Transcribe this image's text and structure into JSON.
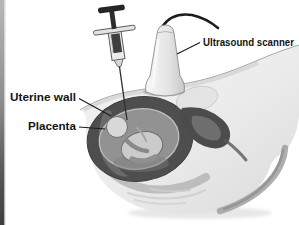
{
  "illustration": {
    "labels": {
      "ultrasound_scanner": "Ultrasound scanner",
      "uterine_wall": "Uterine wall",
      "placenta": "Placenta"
    },
    "palette": {
      "background": "#ffffff",
      "label_text": "#141414",
      "leader_line": "#1a1a1a",
      "uterine_wall_dark": "#4e4e4e",
      "placenta_shade": "#6b6b6b",
      "amniotic_cavity": "#929292",
      "fetus_light": "#d8d8d8",
      "body_skin_light": "#f1f1f1",
      "body_skin_shade": "#dcdcdc",
      "belly_rim_shade": "#a0a0a0",
      "syringe_dark": "#262626",
      "probe_light": "#f5f5f5",
      "cable_dark": "#1d1d1d",
      "page_edge_bar_top": "#b8b8b8",
      "page_edge_bar_bottom": "#3d3d3d"
    }
  }
}
